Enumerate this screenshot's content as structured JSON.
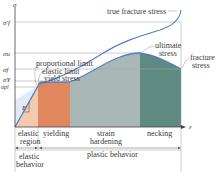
{
  "diagram": {
    "axes": {
      "y_label": "σ",
      "x_label": "ε"
    },
    "stress_levels": [
      {
        "symbol": "σ'f",
        "name": "true fracture stress level",
        "y": 22
      },
      {
        "symbol": "σu",
        "name": "ultimate stress level",
        "y": 53
      },
      {
        "symbol": "σf",
        "name": "fracture stress level",
        "y": 69
      },
      {
        "symbol": "σY",
        "name": "yield stress level",
        "y": 81
      },
      {
        "symbol": "σpl",
        "name": "proportional limit level",
        "y": 87
      }
    ],
    "annotations": {
      "true_fracture_stress": "true fracture stress",
      "ultimate_stress_line1": "ultimate",
      "ultimate_stress_line2": "stress",
      "fracture_stress_line1": "fracture",
      "fracture_stress_line2": "stress",
      "proportional_limit": "proportional limit",
      "elastic_limit": "elastic limit",
      "yield_stress": "yield stress",
      "modulus": "E"
    },
    "regions": [
      {
        "name": "elastic region",
        "line1": "elastic",
        "line2": "region",
        "color": "#f5c9ae"
      },
      {
        "name": "yielding",
        "line1": "yielding",
        "line2": "",
        "color": "#e0875f"
      },
      {
        "name": "strain hardening",
        "line1": "strain",
        "line2": "hardening",
        "color": "#a9b8b6"
      },
      {
        "name": "necking",
        "line1": "necking",
        "line2": "",
        "color": "#5f8a82"
      }
    ],
    "behaviors": [
      {
        "line1": "elastic",
        "line2": "behavior"
      },
      {
        "line1": "plastic behavior",
        "line2": ""
      }
    ],
    "colors": {
      "curve": "#4f7fc6",
      "axis": "#444444",
      "grid": "#9a9a9a",
      "elastic_fill": "#dfe8f4"
    }
  }
}
